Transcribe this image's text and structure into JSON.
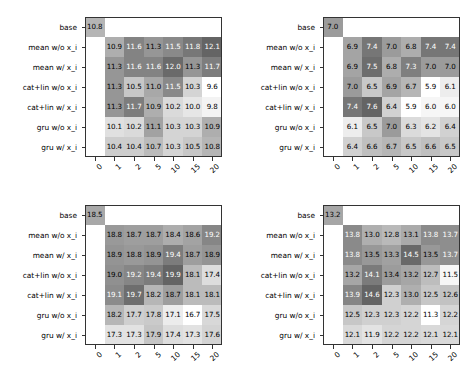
{
  "figure": {
    "layout": "2x2 grid of annotated grayscale heatmaps",
    "rows": 2,
    "cols": 2
  },
  "chart_data": [
    {
      "type": "heatmap",
      "panel": "top-left",
      "title": "",
      "xlabel": "",
      "ylabel": "",
      "colormap": "grayscale (darker = higher)",
      "grid": false,
      "legend": "none",
      "xticklabels": [
        "0",
        "1",
        "2",
        "5",
        "10",
        "15",
        "20"
      ],
      "yticklabels": [
        "base",
        "mean w/o x_i",
        "mean w/ x_i",
        "cat+lin w/o x_i",
        "cat+lin w/ x_i",
        "gru w/o x_i",
        "gru w/ x_i"
      ],
      "vmin": 9.6,
      "vmax": 12.1,
      "rows": [
        {
          "label": "base",
          "values": [
            10.8,
            null,
            null,
            null,
            null,
            null,
            null
          ]
        },
        {
          "label": "mean w/o x_i",
          "values": [
            null,
            10.9,
            11.6,
            11.3,
            11.5,
            11.8,
            12.1
          ]
        },
        {
          "label": "mean w/ x_i",
          "values": [
            null,
            11.3,
            11.6,
            11.6,
            12.0,
            11.3,
            11.7
          ]
        },
        {
          "label": "cat+lin w/o x_i",
          "values": [
            null,
            11.3,
            10.5,
            11.0,
            11.5,
            10.3,
            9.6
          ]
        },
        {
          "label": "cat+lin w/ x_i",
          "values": [
            null,
            11.3,
            11.7,
            10.9,
            10.2,
            10.0,
            9.8
          ]
        },
        {
          "label": "gru w/o x_i",
          "values": [
            null,
            10.1,
            10.2,
            11.1,
            10.3,
            10.3,
            10.9
          ]
        },
        {
          "label": "gru w/ x_i",
          "values": [
            null,
            10.4,
            10.4,
            10.7,
            10.3,
            10.5,
            10.8
          ]
        }
      ]
    },
    {
      "type": "heatmap",
      "panel": "top-right",
      "title": "",
      "xlabel": "",
      "ylabel": "",
      "colormap": "grayscale (darker = higher)",
      "grid": false,
      "legend": "none",
      "xticklabels": [
        "0",
        "1",
        "2",
        "5",
        "10",
        "15",
        "20"
      ],
      "yticklabels": [
        "base",
        "mean w/o x_i",
        "mean w/ x_i",
        "cat+lin w/o x_i",
        "cat+lin w/ x_i",
        "gru w/o x_i",
        "gru w/ x_i"
      ],
      "vmin": 5.9,
      "vmax": 7.6,
      "rows": [
        {
          "label": "base",
          "values": [
            7.0,
            null,
            null,
            null,
            null,
            null,
            null
          ]
        },
        {
          "label": "mean w/o x_i",
          "values": [
            null,
            6.9,
            7.4,
            7.0,
            6.8,
            7.4,
            7.4
          ]
        },
        {
          "label": "mean w/ x_i",
          "values": [
            null,
            6.9,
            7.5,
            6.8,
            7.3,
            7.0,
            7.0
          ]
        },
        {
          "label": "cat+lin w/o x_i",
          "values": [
            null,
            7.0,
            6.5,
            6.9,
            6.7,
            5.9,
            6.1
          ]
        },
        {
          "label": "cat+lin w/ x_i",
          "values": [
            null,
            7.4,
            7.6,
            6.4,
            5.9,
            6.0,
            6.0
          ]
        },
        {
          "label": "gru w/o x_i",
          "values": [
            null,
            6.1,
            6.5,
            7.0,
            6.3,
            6.2,
            6.4
          ]
        },
        {
          "label": "gru w/ x_i",
          "values": [
            null,
            6.4,
            6.6,
            6.7,
            6.5,
            6.6,
            6.5
          ]
        }
      ]
    },
    {
      "type": "heatmap",
      "panel": "bottom-left",
      "title": "",
      "xlabel": "",
      "ylabel": "",
      "colormap": "grayscale (darker = higher)",
      "grid": false,
      "legend": "none",
      "xticklabels": [
        "0",
        "1",
        "2",
        "5",
        "10",
        "15",
        "20"
      ],
      "yticklabels": [
        "base",
        "mean w/o x_i",
        "mean w/ x_i",
        "cat+lin w/o x_i",
        "cat+lin w/ x_i",
        "gru w/o x_i",
        "gru w/ x_i"
      ],
      "vmin": 16.7,
      "vmax": 19.9,
      "rows": [
        {
          "label": "base",
          "values": [
            18.5,
            null,
            null,
            null,
            null,
            null,
            null
          ]
        },
        {
          "label": "mean w/o x_i",
          "values": [
            null,
            18.8,
            18.7,
            18.7,
            18.4,
            18.6,
            19.2
          ]
        },
        {
          "label": "mean w/ x_i",
          "values": [
            null,
            18.9,
            18.8,
            18.9,
            19.4,
            18.7,
            18.9
          ]
        },
        {
          "label": "cat+lin w/o x_i",
          "values": [
            null,
            19.0,
            19.2,
            19.4,
            19.9,
            18.1,
            17.4
          ]
        },
        {
          "label": "cat+lin w/ x_i",
          "values": [
            null,
            19.1,
            19.7,
            18.2,
            18.7,
            18.1,
            18.1
          ]
        },
        {
          "label": "gru w/o x_i",
          "values": [
            null,
            18.2,
            17.7,
            17.8,
            17.1,
            16.7,
            17.5
          ]
        },
        {
          "label": "gru w/ x_i",
          "values": [
            null,
            17.3,
            17.3,
            17.9,
            17.4,
            17.3,
            17.6
          ]
        }
      ]
    },
    {
      "type": "heatmap",
      "panel": "bottom-right",
      "title": "",
      "xlabel": "",
      "ylabel": "",
      "colormap": "grayscale (darker = higher)",
      "grid": false,
      "legend": "none",
      "xticklabels": [
        "0",
        "1",
        "2",
        "5",
        "10",
        "15",
        "20"
      ],
      "yticklabels": [
        "base",
        "mean w/o x_i",
        "mean w/ x_i",
        "cat+lin w/o x_i",
        "cat+lin w/ x_i",
        "gru w/o x_i",
        "gru w/ x_i"
      ],
      "vmin": 11.3,
      "vmax": 14.6,
      "rows": [
        {
          "label": "base",
          "values": [
            13.2,
            null,
            null,
            null,
            null,
            null,
            null
          ]
        },
        {
          "label": "mean w/o x_i",
          "values": [
            null,
            13.8,
            13.0,
            12.8,
            13.1,
            13.8,
            13.7
          ]
        },
        {
          "label": "mean w/ x_i",
          "values": [
            null,
            13.8,
            13.5,
            13.3,
            14.5,
            13.5,
            13.7
          ]
        },
        {
          "label": "cat+lin w/o x_i",
          "values": [
            null,
            13.2,
            14.1,
            13.4,
            13.2,
            12.7,
            11.5
          ]
        },
        {
          "label": "cat+lin w/ x_i",
          "values": [
            null,
            13.9,
            14.6,
            12.3,
            13.0,
            12.5,
            12.6
          ]
        },
        {
          "label": "gru w/o x_i",
          "values": [
            null,
            12.5,
            12.3,
            12.3,
            12.2,
            11.3,
            12.2
          ]
        },
        {
          "label": "gru w/ x_i",
          "values": [
            null,
            12.1,
            11.9,
            12.2,
            12.2,
            12.1,
            12.1
          ]
        }
      ]
    }
  ]
}
